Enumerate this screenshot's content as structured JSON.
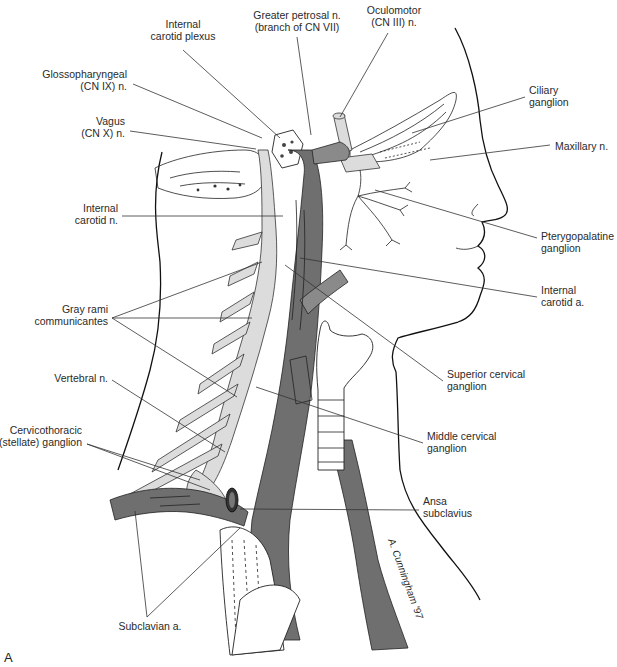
{
  "figure": {
    "panel_label": "A",
    "colors": {
      "artery": "#6f6f6f",
      "nerve_trunk": "#dcdcdc",
      "outline": "#111111",
      "background": "#ffffff"
    }
  },
  "labels": [
    {
      "id": "internal-carotid-plexus",
      "lines": [
        "Internal",
        "carotid plexus"
      ],
      "x": 183,
      "y": 28,
      "anchor": "middle",
      "leader": [
        [
          183,
          50
        ],
        [
          280,
          138
        ]
      ]
    },
    {
      "id": "greater-petrosal-n",
      "lines": [
        "Greater petrosal n.",
        "(branch of CN VII)"
      ],
      "x": 297,
      "y": 19,
      "anchor": "middle",
      "leader": [
        [
          297,
          37
        ],
        [
          311,
          135
        ]
      ]
    },
    {
      "id": "oculomotor-n",
      "lines": [
        "Oculomotor",
        "(CN III) n."
      ],
      "x": 394,
      "y": 14,
      "anchor": "middle",
      "leader": [
        [
          388,
          33
        ],
        [
          340,
          117
        ]
      ]
    },
    {
      "id": "glossopharyngeal-n",
      "lines": [
        "Glossopharyngeal",
        "(CN IX) n."
      ],
      "x": 127,
      "y": 78,
      "anchor": "end",
      "leader": [
        [
          133,
          84
        ],
        [
          262,
          138
        ]
      ]
    },
    {
      "id": "vagus-n",
      "lines": [
        "Vagus",
        "(CN X) n."
      ],
      "x": 125,
      "y": 125,
      "anchor": "end",
      "leader": [
        [
          130,
          131
        ],
        [
          256,
          149
        ]
      ]
    },
    {
      "id": "ciliary-ganglion",
      "lines": [
        "Ciliary",
        "ganglion"
      ],
      "x": 529,
      "y": 94,
      "anchor": "start",
      "leader": [
        [
          525,
          97
        ],
        [
          412,
          133
        ]
      ]
    },
    {
      "id": "maxillary-n",
      "lines": [
        "Maxillary n."
      ],
      "x": 555,
      "y": 150,
      "anchor": "start",
      "leader": [
        [
          550,
          145
        ],
        [
          430,
          160
        ]
      ]
    },
    {
      "id": "internal-carotid-n",
      "lines": [
        "Internal",
        "carotid n."
      ],
      "x": 118,
      "y": 212,
      "anchor": "end",
      "leader": [
        [
          122,
          216
        ],
        [
          283,
          216
        ]
      ]
    },
    {
      "id": "pterygopalatine-ganglion",
      "lines": [
        "Pterygopalatine",
        "ganglion"
      ],
      "x": 541,
      "y": 240,
      "anchor": "start",
      "leader": [
        [
          537,
          238
        ],
        [
          375,
          190
        ]
      ]
    },
    {
      "id": "internal-carotid-a",
      "lines": [
        "Internal",
        "carotid a."
      ],
      "x": 541,
      "y": 294,
      "anchor": "start",
      "leader": [
        [
          537,
          297
        ],
        [
          300,
          258
        ]
      ]
    },
    {
      "id": "gray-rami-communicantes",
      "lines": [
        "Gray rami",
        "communicantes"
      ],
      "x": 108,
      "y": 313,
      "anchor": "end",
      "leader": [
        [
          112,
          318
        ],
        [
          262,
          262
        ]
      ],
      "extra_leaders": [
        [
          [
            112,
            318
          ],
          [
            252,
            318
          ]
        ],
        [
          [
            112,
            318
          ],
          [
            237,
            397
          ]
        ]
      ]
    },
    {
      "id": "superior-cervical-ganglion",
      "lines": [
        "Superior cervical",
        "ganglion"
      ],
      "x": 447,
      "y": 378,
      "anchor": "start",
      "leader": [
        [
          443,
          381
        ],
        [
          285,
          265
        ]
      ]
    },
    {
      "id": "vertebral-n",
      "lines": [
        "Vertebral n."
      ],
      "x": 108,
      "y": 382,
      "anchor": "end",
      "leader": [
        [
          112,
          380
        ],
        [
          225,
          452
        ]
      ]
    },
    {
      "id": "middle-cervical-ganglion",
      "lines": [
        "Middle cervical",
        "ganglion"
      ],
      "x": 427,
      "y": 440,
      "anchor": "start",
      "leader": [
        [
          423,
          443
        ],
        [
          256,
          387
        ]
      ]
    },
    {
      "id": "cervicothoracic-ganglion",
      "lines": [
        "Cervicothoracic",
        "(stellate) ganglion"
      ],
      "x": 82,
      "y": 434,
      "anchor": "end",
      "leader": [
        [
          87,
          444
        ],
        [
          200,
          480
        ]
      ],
      "extra_leaders": [
        [
          [
            87,
            444
          ],
          [
            210,
            490
          ]
        ]
      ]
    },
    {
      "id": "ansa-subclavius",
      "lines": [
        "Ansa",
        "subclavius"
      ],
      "x": 423,
      "y": 505,
      "anchor": "start",
      "leader": [
        [
          419,
          510
        ],
        [
          240,
          509
        ]
      ]
    },
    {
      "id": "subclavian-a",
      "lines": [
        "Subclavian a."
      ],
      "x": 150,
      "y": 630,
      "anchor": "middle",
      "leader": [
        [
          147,
          617
        ],
        [
          135,
          511
        ]
      ],
      "extra_leaders": [
        [
          [
            147,
            617
          ],
          [
            240,
            528
          ]
        ]
      ]
    }
  ],
  "signature": "A. Cunningham '97"
}
